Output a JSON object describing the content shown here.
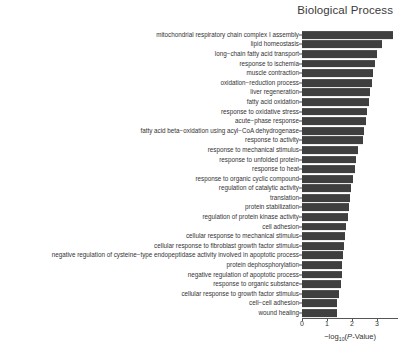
{
  "chart_data": {
    "type": "bar",
    "orientation": "horizontal",
    "title": "Biological Process",
    "xlabel": "-log10(P-Value)",
    "xlabel_parts": {
      "minus": "−",
      "log": "log",
      "sub": "10",
      "open": "(",
      "italic": "P",
      "rest": "-Value",
      "close": ")"
    },
    "ylabel": "",
    "xlim": [
      0,
      3.85
    ],
    "xticks": [
      0,
      1,
      2,
      3
    ],
    "xticklabels": [
      "0",
      "1",
      "2",
      "3"
    ],
    "grid": false,
    "legend": false,
    "bar_color": "#3f3f3f",
    "categories": [
      "mitochondrial respiratory chain complex I assembly",
      "lipid homeostasis",
      "long−chain fatty acid transport",
      "response to ischemia",
      "muscle contraction",
      "oxidation−reduction process",
      "liver regeneration",
      "fatty acid oxidation",
      "response to oxidative stress",
      "acute−phase response",
      "fatty acid beta−oxidation using acyl−CoA dehydrogenase",
      "response to activity",
      "response to mechanical stimulus",
      "response to unfolded protein",
      "response to heat",
      "response to organic cyclic compound",
      "regulation of catalytic activity",
      "translation",
      "protein stabilization",
      "regulation of protein kinase activity",
      "cell adhesion",
      "cellular response to mechanical stimulus",
      "cellular response to fibroblast growth factor stimulus",
      "negative regulation of cysteine−type endopeptidase activity involved in apoptotic process",
      "protein dephosphorylation",
      "negative regulation of apoptotic process",
      "response to organic substance",
      "cellular response to growth factor stimulus",
      "cell−cell adhesion",
      "wound healing"
    ],
    "values": [
      3.62,
      3.18,
      2.98,
      2.9,
      2.84,
      2.78,
      2.72,
      2.66,
      2.58,
      2.54,
      2.48,
      2.42,
      2.22,
      2.16,
      2.1,
      2.02,
      1.96,
      1.9,
      1.86,
      1.82,
      1.76,
      1.7,
      1.66,
      1.62,
      1.6,
      1.58,
      1.56,
      1.48,
      1.4,
      1.38
    ]
  }
}
